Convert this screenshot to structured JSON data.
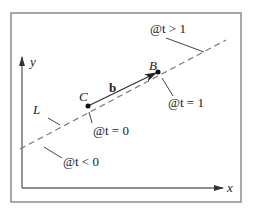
{
  "diagram": {
    "colors": {
      "frame": "#8a8a8a",
      "axis": "#6a6a6a",
      "line": "#7a7a7a",
      "vector": "#333333",
      "point": "#111111",
      "text": "#222222"
    },
    "axes": {
      "x_label": "x",
      "y_label": "y"
    },
    "line": {
      "label": "L",
      "style": "dashed"
    },
    "vector": {
      "label": "b",
      "from": "C",
      "to": "B"
    },
    "points": [
      {
        "name": "C",
        "label": "C",
        "annotation": "@t = 0"
      },
      {
        "name": "B",
        "label": "B",
        "annotation": "@t = 1"
      }
    ],
    "regions": [
      {
        "annotation": "@t > 1"
      },
      {
        "annotation": "@t < 0"
      }
    ]
  }
}
